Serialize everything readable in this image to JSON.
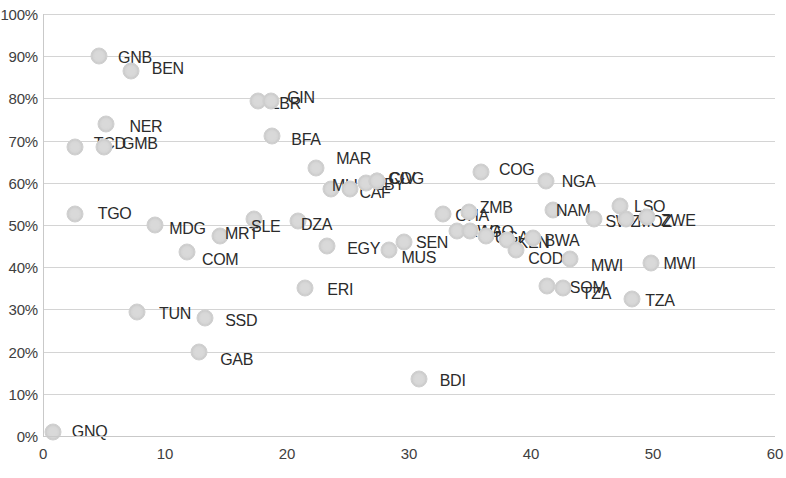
{
  "chart_data": {
    "type": "scatter",
    "title": "",
    "xlabel": "",
    "ylabel": "",
    "xlim": [
      0,
      60
    ],
    "ylim": [
      0,
      1.0
    ],
    "grid": true,
    "legend": false,
    "x_ticks": [
      "0",
      "10",
      "20",
      "30",
      "40",
      "50",
      "60"
    ],
    "x_tick_values": [
      0,
      10,
      20,
      30,
      40,
      50,
      60
    ],
    "y_ticks": [
      "0%",
      "10%",
      "20%",
      "30%",
      "40%",
      "50%",
      "60%",
      "70%",
      "80%",
      "90%",
      "100%"
    ],
    "y_tick_values": [
      0,
      10,
      20,
      30,
      40,
      50,
      60,
      70,
      80,
      90,
      100
    ],
    "marker_color": "#d9d9d9",
    "points": [
      {
        "label": "GNQ",
        "x": 0.8,
        "y": 1.0,
        "lx": 10,
        "ly": 0
      },
      {
        "label": "TGO",
        "x": 2.6,
        "y": 52.5,
        "lx": 14,
        "ly": 0
      },
      {
        "label": "GNB",
        "x": 4.6,
        "y": 90.0,
        "lx": 10,
        "ly": 2
      },
      {
        "label": "TCD",
        "x": 2.6,
        "y": 68.5,
        "lx": 10,
        "ly": -3
      },
      {
        "label": "GMB",
        "x": 5.0,
        "y": 68.5,
        "lx": 9,
        "ly": -3
      },
      {
        "label": "BEN",
        "x": 7.2,
        "y": 86.5,
        "lx": 12,
        "ly": -2
      },
      {
        "label": "NER",
        "x": 5.2,
        "y": 74.0,
        "lx": 14,
        "ly": 3
      },
      {
        "label": "TUN",
        "x": 7.7,
        "y": 29.5,
        "lx": 13,
        "ly": 2
      },
      {
        "label": "MDG",
        "x": 9.2,
        "y": 50.0,
        "lx": 5,
        "ly": 4
      },
      {
        "label": "COM",
        "x": 11.8,
        "y": 43.5,
        "lx": 6,
        "ly": 8
      },
      {
        "label": "MRT",
        "x": 14.5,
        "y": 47.5,
        "lx": -4,
        "ly": -2
      },
      {
        "label": "SSD",
        "x": 13.3,
        "y": 28.0,
        "lx": 11,
        "ly": 3
      },
      {
        "label": "GAB",
        "x": 12.8,
        "y": 20.0,
        "lx": 12,
        "ly": 8
      },
      {
        "label": "SLE",
        "x": 17.3,
        "y": 51.5,
        "lx": -12,
        "ly": 8
      },
      {
        "label": "LBR",
        "x": 17.6,
        "y": 79.3,
        "lx": 4,
        "ly": 3
      },
      {
        "label": "GIN",
        "x": 18.7,
        "y": 79.3,
        "lx": 7,
        "ly": -3
      },
      {
        "label": "BFA",
        "x": 18.8,
        "y": 71.0,
        "lx": 10,
        "ly": 4
      },
      {
        "label": "DZA",
        "x": 20.9,
        "y": 51.0,
        "lx": -6,
        "ly": 4
      },
      {
        "label": "ERI",
        "x": 21.5,
        "y": 35.0,
        "lx": 13,
        "ly": 2
      },
      {
        "label": "MAR",
        "x": 22.4,
        "y": 63.5,
        "lx": 11,
        "ly": -9
      },
      {
        "label": "EGY",
        "x": 23.3,
        "y": 45.0,
        "lx": 11,
        "ly": 3
      },
      {
        "label": "MLI",
        "x": 23.6,
        "y": 58.5,
        "lx": -8,
        "ly": -3
      },
      {
        "label": "CAF",
        "x": 25.2,
        "y": 58.5,
        "lx": 0,
        "ly": 4
      },
      {
        "label": "LBY",
        "x": 26.5,
        "y": 60.0,
        "lx": 0,
        "ly": 2
      },
      {
        "label": "CIV",
        "x": 27.4,
        "y": 60.5,
        "lx": 3,
        "ly": -2
      },
      {
        "label": "COG",
        "x": 27.4,
        "y": 60.5,
        "lx": 2,
        "ly": -2
      },
      {
        "label": "MUS",
        "x": 28.4,
        "y": 44.0,
        "lx": 3,
        "ly": 8
      },
      {
        "label": "SEN",
        "x": 29.6,
        "y": 46.0,
        "lx": 3,
        "ly": 1
      },
      {
        "label": "BDI",
        "x": 30.8,
        "y": 13.5,
        "lx": 12,
        "ly": 2
      },
      {
        "label": "GHA",
        "x": 32.8,
        "y": 52.5,
        "lx": 3,
        "ly": 2
      },
      {
        "label": "RWA",
        "x": 33.9,
        "y": 48.5,
        "lx": 1,
        "ly": 1
      },
      {
        "label": "AGO",
        "x": 35.0,
        "y": 48.5,
        "lx": 0,
        "ly": 1
      },
      {
        "label": "UGA",
        "x": 36.3,
        "y": 47.5,
        "lx": 0,
        "ly": 2
      },
      {
        "label": "ZMB",
        "x": 34.9,
        "y": 53.0,
        "lx": 2,
        "ly": -4
      },
      {
        "label": "COG2",
        "x": 35.9,
        "y": 62.5,
        "lx": 9,
        "ly": -2
      },
      {
        "label": "KEN",
        "x": 38.0,
        "y": 46.5,
        "lx": 2,
        "ly": 3
      },
      {
        "label": "COD",
        "x": 38.8,
        "y": 44.0,
        "lx": 3,
        "ly": 9
      },
      {
        "label": "BWA",
        "x": 40.2,
        "y": 47.0,
        "lx": 2,
        "ly": 3
      },
      {
        "label": "NGA",
        "x": 41.2,
        "y": 60.5,
        "lx": 7,
        "ly": 1
      },
      {
        "label": "NAM",
        "x": 41.8,
        "y": 53.5,
        "lx": -6,
        "ly": 1
      },
      {
        "label": "SOM",
        "x": 41.3,
        "y": 35.5,
        "lx": 14,
        "ly": 2
      },
      {
        "label": "TZA",
        "x": 42.6,
        "y": 35.0,
        "lx": 10,
        "ly": 6
      },
      {
        "label": "MWI",
        "x": 43.2,
        "y": 42.0,
        "lx": 12,
        "ly": 7
      },
      {
        "label": "SWZ",
        "x": 45.2,
        "y": 51.5,
        "lx": 2,
        "ly": 3
      },
      {
        "label": "LSO",
        "x": 47.3,
        "y": 54.5,
        "lx": 5,
        "ly": 1
      },
      {
        "label": "MOZ",
        "x": 47.8,
        "y": 51.5,
        "lx": 2,
        "ly": 3
      },
      {
        "label": "ZWE",
        "x": 49.5,
        "y": 52.0,
        "lx": 5,
        "ly": 4
      },
      {
        "label": "MWI2",
        "x": 49.8,
        "y": 41.0,
        "lx": 4,
        "ly": 1
      },
      {
        "label": "TZA2",
        "x": 48.3,
        "y": 32.5,
        "lx": 4,
        "ly": 2
      }
    ]
  }
}
